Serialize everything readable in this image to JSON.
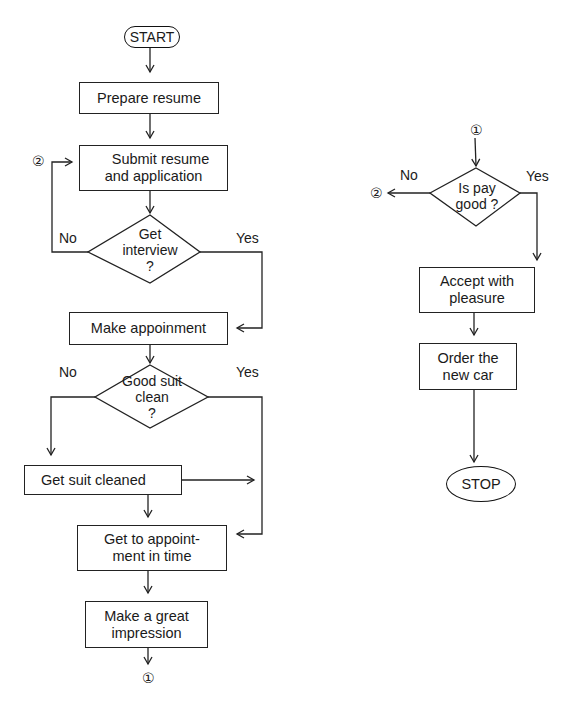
{
  "diagram": {
    "type": "flowchart",
    "title": "",
    "left_flow": {
      "start": "START",
      "steps": {
        "prepare_resume": "Prepare resume",
        "submit_line1": "Submit resume",
        "submit_line2": "and application",
        "make_appointment": "Make appoinment",
        "get_suit_cleaned": "Get suit cleaned",
        "get_to_line1": "Get to appoint-",
        "get_to_line2": "ment in time",
        "impression_line1": "Make a great",
        "impression_line2": "impression"
      },
      "decisions": {
        "interview_line1": "Get",
        "interview_line2": "interview",
        "interview_line3": "?",
        "interview_no": "No",
        "interview_yes": "Yes",
        "suit_line1": "Good suit",
        "suit_line2": "clean",
        "suit_line3": "?",
        "suit_no": "No",
        "suit_yes": "Yes"
      },
      "connector_in": "②",
      "connector_out": "①"
    },
    "right_flow": {
      "connector_in": "①",
      "decision_line1": "Is pay",
      "decision_line2": "good ?",
      "decision_no": "No",
      "decision_yes": "Yes",
      "connector_out": "②",
      "accept_line1": "Accept with",
      "accept_line2": "pleasure",
      "order_line1": "Order the",
      "order_line2": "new car",
      "stop": "STOP"
    }
  }
}
